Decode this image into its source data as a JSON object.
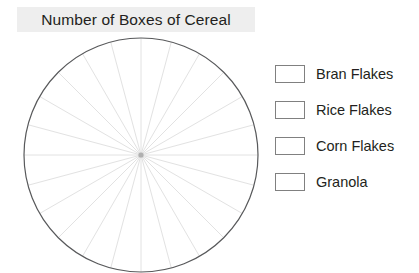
{
  "chart": {
    "title": "Number of Boxes of Cereal",
    "title_highlight_color": "#eeeeee",
    "title_text_color": "#231f20"
  },
  "chart_data": {
    "type": "pie",
    "title": "Number of Boxes of Cereal",
    "subtitle": "",
    "xlabel": "",
    "ylabel": "",
    "note": "Blank pie-chart template: radial guide lines only, no shaded sectors and no plotted values.",
    "categories": [
      "Bran Flakes",
      "Rice Flakes",
      "Corn Flakes",
      "Granola"
    ],
    "values": [
      null,
      null,
      null,
      null
    ],
    "slice_colors": [
      "#ffffff",
      "#ffffff",
      "#ffffff",
      "#ffffff"
    ],
    "legend_position": "right",
    "grid": true,
    "grid_spokes": 24,
    "grid_spoke_degrees": 15,
    "outline_color": "#58595b",
    "spoke_color": "#e2e2e2",
    "center_marker_color": "#b0b0b0"
  },
  "legend": {
    "items": [
      {
        "label": "Bran Flakes",
        "swatch_color": "#ffffff"
      },
      {
        "label": "Rice Flakes",
        "swatch_color": "#ffffff"
      },
      {
        "label": "Corn Flakes",
        "swatch_color": "#ffffff"
      },
      {
        "label": "Granola",
        "swatch_color": "#ffffff"
      }
    ]
  }
}
